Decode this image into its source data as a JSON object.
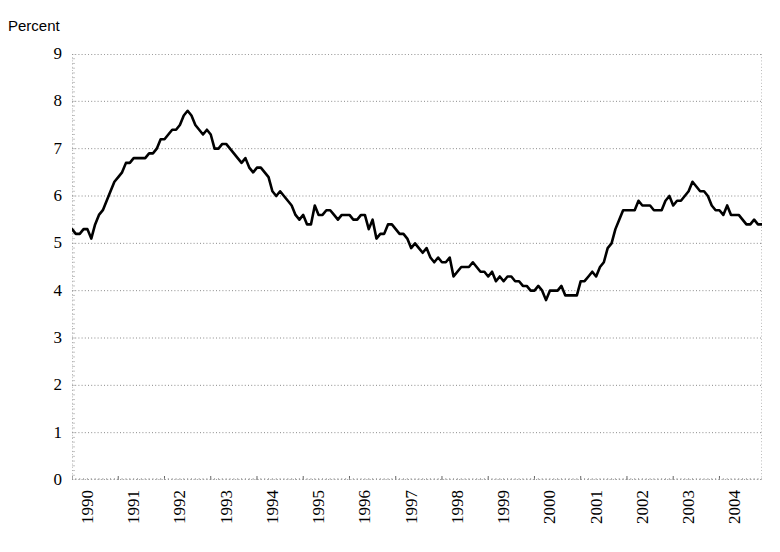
{
  "chart_data": {
    "type": "line",
    "title": "",
    "subtitle": "",
    "xlabel": "",
    "ylabel": "Percent",
    "ylim": [
      0,
      9
    ],
    "xlim": [
      1990.0,
      2004.92
    ],
    "grid": true,
    "legend_position": "none",
    "line_color": "#000000",
    "y_ticks": [
      9,
      8,
      7,
      6,
      5,
      4,
      3,
      2,
      1,
      0
    ],
    "x_ticks": [
      "1990",
      "1991",
      "1992",
      "1993",
      "1994",
      "1995",
      "1996",
      "1997",
      "1998",
      "1999",
      "2000",
      "2001",
      "2002",
      "2003",
      "2004"
    ],
    "series": [
      {
        "name": "Unemployment rate",
        "x": [
          1990.0,
          1990.083,
          1990.167,
          1990.25,
          1990.333,
          1990.417,
          1990.5,
          1990.583,
          1990.667,
          1990.75,
          1990.833,
          1990.917,
          1991.0,
          1991.083,
          1991.167,
          1991.25,
          1991.333,
          1991.417,
          1991.5,
          1991.583,
          1991.667,
          1991.75,
          1991.833,
          1991.917,
          1992.0,
          1992.083,
          1992.167,
          1992.25,
          1992.333,
          1992.417,
          1992.5,
          1992.583,
          1992.667,
          1992.75,
          1992.833,
          1992.917,
          1993.0,
          1993.083,
          1993.167,
          1993.25,
          1993.333,
          1993.417,
          1993.5,
          1993.583,
          1993.667,
          1993.75,
          1993.833,
          1993.917,
          1994.0,
          1994.083,
          1994.167,
          1994.25,
          1994.333,
          1994.417,
          1994.5,
          1994.583,
          1994.667,
          1994.75,
          1994.833,
          1994.917,
          1995.0,
          1995.083,
          1995.167,
          1995.25,
          1995.333,
          1995.417,
          1995.5,
          1995.583,
          1995.667,
          1995.75,
          1995.833,
          1995.917,
          1996.0,
          1996.083,
          1996.167,
          1996.25,
          1996.333,
          1996.417,
          1996.5,
          1996.583,
          1996.667,
          1996.75,
          1996.833,
          1996.917,
          1997.0,
          1997.083,
          1997.167,
          1997.25,
          1997.333,
          1997.417,
          1997.5,
          1997.583,
          1997.667,
          1997.75,
          1997.833,
          1997.917,
          1998.0,
          1998.083,
          1998.167,
          1998.25,
          1998.333,
          1998.417,
          1998.5,
          1998.583,
          1998.667,
          1998.75,
          1998.833,
          1998.917,
          1999.0,
          1999.083,
          1999.167,
          1999.25,
          1999.333,
          1999.417,
          1999.5,
          1999.583,
          1999.667,
          1999.75,
          1999.833,
          1999.917,
          2000.0,
          2000.083,
          2000.167,
          2000.25,
          2000.333,
          2000.417,
          2000.5,
          2000.583,
          2000.667,
          2000.75,
          2000.833,
          2000.917,
          2001.0,
          2001.083,
          2001.167,
          2001.25,
          2001.333,
          2001.417,
          2001.5,
          2001.583,
          2001.667,
          2001.75,
          2001.833,
          2001.917,
          2002.0,
          2002.083,
          2002.167,
          2002.25,
          2002.333,
          2002.417,
          2002.5,
          2002.583,
          2002.667,
          2002.75,
          2002.833,
          2002.917,
          2003.0,
          2003.083,
          2003.167,
          2003.25,
          2003.333,
          2003.417,
          2003.5,
          2003.583,
          2003.667,
          2003.75,
          2003.833,
          2003.917,
          2004.0,
          2004.083,
          2004.167,
          2004.25,
          2004.333,
          2004.417,
          2004.5,
          2004.583,
          2004.667,
          2004.75,
          2004.833,
          2004.917
        ],
        "values": [
          5.3,
          5.2,
          5.2,
          5.3,
          5.3,
          5.1,
          5.4,
          5.6,
          5.7,
          5.9,
          6.1,
          6.3,
          6.4,
          6.5,
          6.7,
          6.7,
          6.8,
          6.8,
          6.8,
          6.8,
          6.9,
          6.9,
          7.0,
          7.2,
          7.2,
          7.3,
          7.4,
          7.4,
          7.5,
          7.7,
          7.8,
          7.7,
          7.5,
          7.4,
          7.3,
          7.4,
          7.3,
          7.0,
          7.0,
          7.1,
          7.1,
          7.0,
          6.9,
          6.8,
          6.7,
          6.8,
          6.6,
          6.5,
          6.6,
          6.6,
          6.5,
          6.4,
          6.1,
          6.0,
          6.1,
          6.0,
          5.9,
          5.8,
          5.6,
          5.5,
          5.6,
          5.4,
          5.4,
          5.8,
          5.6,
          5.6,
          5.7,
          5.7,
          5.6,
          5.5,
          5.6,
          5.6,
          5.6,
          5.5,
          5.5,
          5.6,
          5.6,
          5.3,
          5.5,
          5.1,
          5.2,
          5.2,
          5.4,
          5.4,
          5.3,
          5.2,
          5.2,
          5.1,
          4.9,
          5.0,
          4.9,
          4.8,
          4.9,
          4.7,
          4.6,
          4.7,
          4.6,
          4.6,
          4.7,
          4.3,
          4.4,
          4.5,
          4.5,
          4.5,
          4.6,
          4.5,
          4.4,
          4.4,
          4.3,
          4.4,
          4.2,
          4.3,
          4.2,
          4.3,
          4.3,
          4.2,
          4.2,
          4.1,
          4.1,
          4.0,
          4.0,
          4.1,
          4.0,
          3.8,
          4.0,
          4.0,
          4.0,
          4.1,
          3.9,
          3.9,
          3.9,
          3.9,
          4.2,
          4.2,
          4.3,
          4.4,
          4.3,
          4.5,
          4.6,
          4.9,
          5.0,
          5.3,
          5.5,
          5.7,
          5.7,
          5.7,
          5.7,
          5.9,
          5.8,
          5.8,
          5.8,
          5.7,
          5.7,
          5.7,
          5.9,
          6.0,
          5.8,
          5.9,
          5.9,
          6.0,
          6.1,
          6.3,
          6.2,
          6.1,
          6.1,
          6.0,
          5.8,
          5.7,
          5.7,
          5.6,
          5.8,
          5.6,
          5.6,
          5.6,
          5.5,
          5.4,
          5.4,
          5.5,
          5.4,
          5.4
        ]
      }
    ]
  },
  "axis": {
    "y_label": "Percent"
  }
}
